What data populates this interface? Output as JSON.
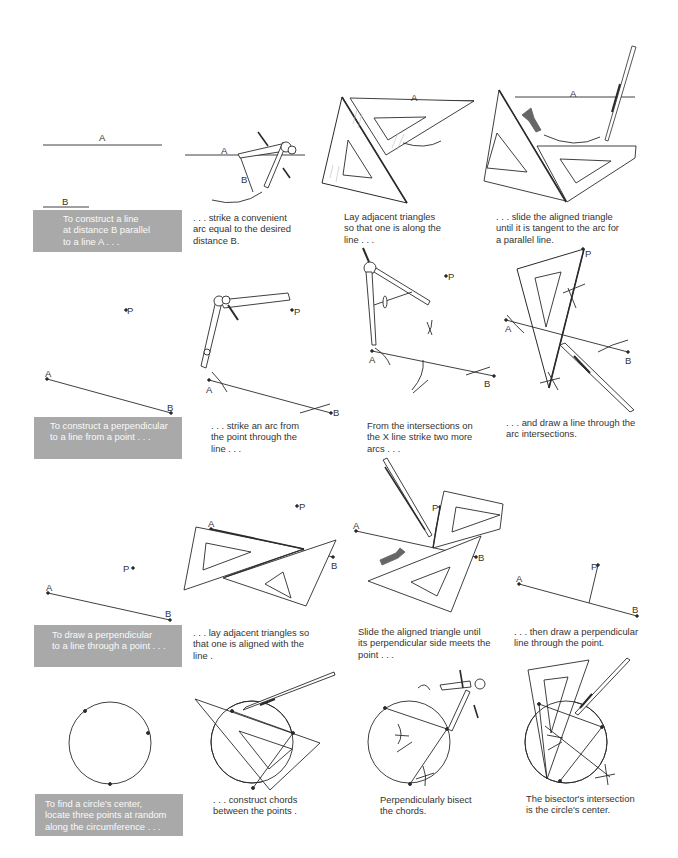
{
  "rows": [
    {
      "intro_box": "To construct a line\nat distance B parallel\nto a line A . . .",
      "steps": [
        "Lay adjacent triangles\n so that one is along the\n line . . .",
        ". . . slide the aligned triangle\nuntil it is tangent to the arc for\na parallel line."
      ],
      "step0_caption": ". . . strike a convenient\narc equal to the desired\ndistance B."
    },
    {
      "intro_box": "To construct a perpendicular\nto a line from a point . . .",
      "step0_caption": ". . . strike an arc from\nthe point through the\nline . . .",
      "steps": [
        "From the intersections on\n the X line strike two more\n arcs . . .",
        ". . . and draw a line through the\narc intersections."
      ]
    },
    {
      "intro_box": "To draw a perpendicular\nto a line through a point . . .",
      "step0_caption": ". . . lay adjacent triangles so\nthat one is aligned with the\nline .",
      "steps": [
        "Slide the aligned triangle until\nits perpendicular side meets the\npoint . . .",
        ". . . then draw a perpendicular\nline through the point."
      ]
    },
    {
      "intro_box": "To find a circle's center,\nlocate three points at random\nalong the circumference . . .",
      "step0_caption": ". . . construct chords\nbetween the points .",
      "steps": [
        "Perpendicularly bisect\nthe chords.",
        "The bisector's intersection\nis the circle's center."
      ]
    }
  ],
  "labels": {
    "a": "A",
    "b": "B",
    "p": "P"
  },
  "colors": {
    "box": "#a9a9a9",
    "ink": "#2a2a2a",
    "arrow": "#666666"
  }
}
